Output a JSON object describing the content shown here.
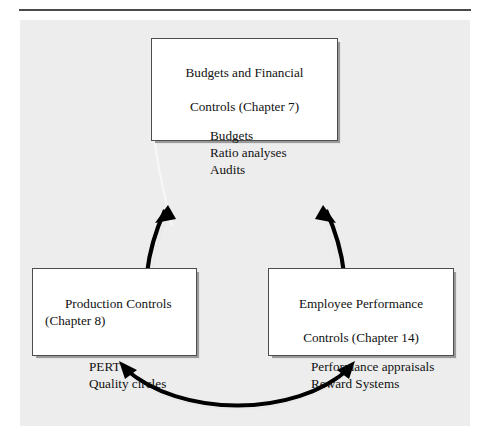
{
  "figure": {
    "background_color": "#ededed",
    "rule_color": "#4a4a4a",
    "box_fill": "#ffffff",
    "box_border_color": "#4d4d4d",
    "arrow_color": "#000000"
  },
  "nodes": [
    {
      "id": "budgets",
      "title_line1": "Budgets and Financial",
      "title_line2": "Controls (Chapter 7)",
      "items": [
        "Budgets",
        "Ratio analyses",
        "Audits"
      ]
    },
    {
      "id": "production",
      "title_line1": "Production Controls",
      "title_line2": "(Chapter 8)",
      "items": [
        "PERT",
        "Quality circles"
      ]
    },
    {
      "id": "employee",
      "title_line1": "Employee Performance",
      "title_line2": "Controls (Chapter 14)",
      "items": [
        "Performance appraisals",
        "Reward Systems"
      ]
    }
  ],
  "connectors": [
    {
      "id": "left-connector",
      "from": "budgets",
      "to": "production",
      "style": "double-headed-curved-arrow"
    },
    {
      "id": "right-connector",
      "from": "budgets",
      "to": "employee",
      "style": "double-headed-curved-arrow"
    },
    {
      "id": "bottom-connector",
      "from": "production",
      "to": "employee",
      "style": "double-headed-curved-arrow"
    }
  ]
}
